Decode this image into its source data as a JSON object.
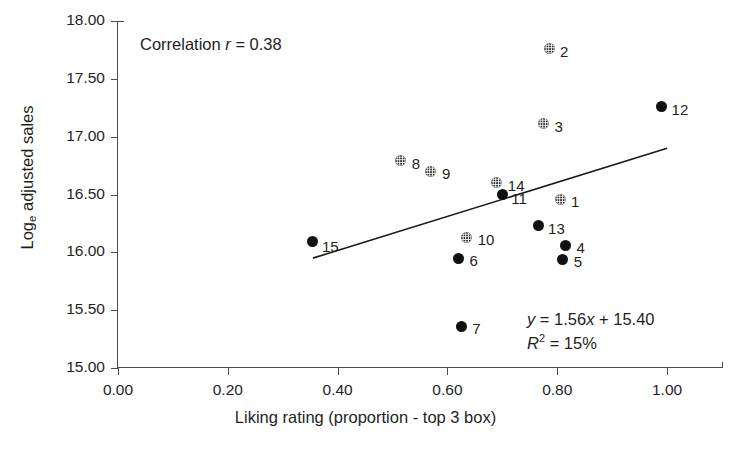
{
  "chart_data": {
    "type": "scatter",
    "title": "",
    "xlabel": "Liking rating (proportion - top 3 box)",
    "ylabel": "Log_e adjusted sales",
    "ylabel_base": "Log",
    "ylabel_sub": "e",
    "ylabel_rest": " adjusted sales",
    "xlim": [
      0.0,
      1.1
    ],
    "ylim": [
      15.0,
      18.0
    ],
    "grid": false,
    "legend": "none",
    "xticks": [
      "0.00",
      "0.20",
      "0.40",
      "0.60",
      "0.80",
      "1.00"
    ],
    "xtick_values": [
      0.0,
      0.2,
      0.4,
      0.6,
      0.8,
      1.0
    ],
    "yticks": [
      "15.00",
      "15.50",
      "16.00",
      "16.50",
      "17.00",
      "17.50",
      "18.00"
    ],
    "ytick_values": [
      15.0,
      15.5,
      16.0,
      16.5,
      17.0,
      17.5,
      18.0
    ],
    "annotations": {
      "correlation_prefix": "Correlation ",
      "correlation_symbol": "r",
      "correlation_value": " = 0.38",
      "correlation_full": "Correlation r = 0.38",
      "equation_symbol": "y",
      "equation_body": " = 1.56",
      "equation_x": "x",
      "equation_tail": " + 15.40",
      "equation_full": "y = 1.56x + 15.40",
      "r2_symbol": "R",
      "r2_exponent": "2",
      "r2_value": " = 15%",
      "r2_full": "R2 = 15%"
    },
    "trendline": {
      "slope": 1.56,
      "intercept": 15.4,
      "x_start": 0.355,
      "x_end": 1.0,
      "y_start": 15.95,
      "y_end": 16.9,
      "color": "#1a1a1a"
    },
    "marker_styles": {
      "solid": "#111111",
      "hatched": "#2b2b2b"
    },
    "points": [
      {
        "label": "1",
        "x": 0.805,
        "y": 16.46,
        "style": "hatched",
        "label_dx": 11,
        "label_dy": -5
      },
      {
        "label": "2",
        "x": 0.785,
        "y": 17.76,
        "style": "hatched",
        "label_dx": 11,
        "label_dy": -5
      },
      {
        "label": "3",
        "x": 0.775,
        "y": 17.11,
        "style": "hatched",
        "label_dx": 11,
        "label_dy": -5
      },
      {
        "label": "4",
        "x": 0.815,
        "y": 16.06,
        "style": "solid",
        "label_dx": 11,
        "label_dy": -5
      },
      {
        "label": "5",
        "x": 0.81,
        "y": 15.94,
        "style": "solid",
        "label_dx": 11,
        "label_dy": -5
      },
      {
        "label": "6",
        "x": 0.62,
        "y": 15.95,
        "style": "solid",
        "label_dx": 11,
        "label_dy": -5
      },
      {
        "label": "7",
        "x": 0.625,
        "y": 15.36,
        "style": "solid",
        "label_dx": 11,
        "label_dy": -5
      },
      {
        "label": "8",
        "x": 0.515,
        "y": 16.79,
        "style": "hatched",
        "label_dx": 11,
        "label_dy": -5
      },
      {
        "label": "9",
        "x": 0.57,
        "y": 16.7,
        "style": "hatched",
        "label_dx": 11,
        "label_dy": -5
      },
      {
        "label": "10",
        "x": 0.635,
        "y": 16.13,
        "style": "hatched",
        "label_dx": 11,
        "label_dy": -5
      },
      {
        "label": "11",
        "x": 0.7,
        "y": 16.5,
        "style": "solid",
        "label_dx": 9,
        "label_dy": -4
      },
      {
        "label": "12",
        "x": 0.99,
        "y": 17.26,
        "style": "solid",
        "label_dx": 10,
        "label_dy": -5
      },
      {
        "label": "13",
        "x": 0.765,
        "y": 16.23,
        "style": "solid",
        "label_dx": 10,
        "label_dy": -5
      },
      {
        "label": "14",
        "x": 0.69,
        "y": 16.6,
        "style": "hatched",
        "label_dx": 11,
        "label_dy": -5
      },
      {
        "label": "15",
        "x": 0.355,
        "y": 16.09,
        "style": "solid",
        "label_dx": 9,
        "label_dy": -3
      }
    ]
  }
}
